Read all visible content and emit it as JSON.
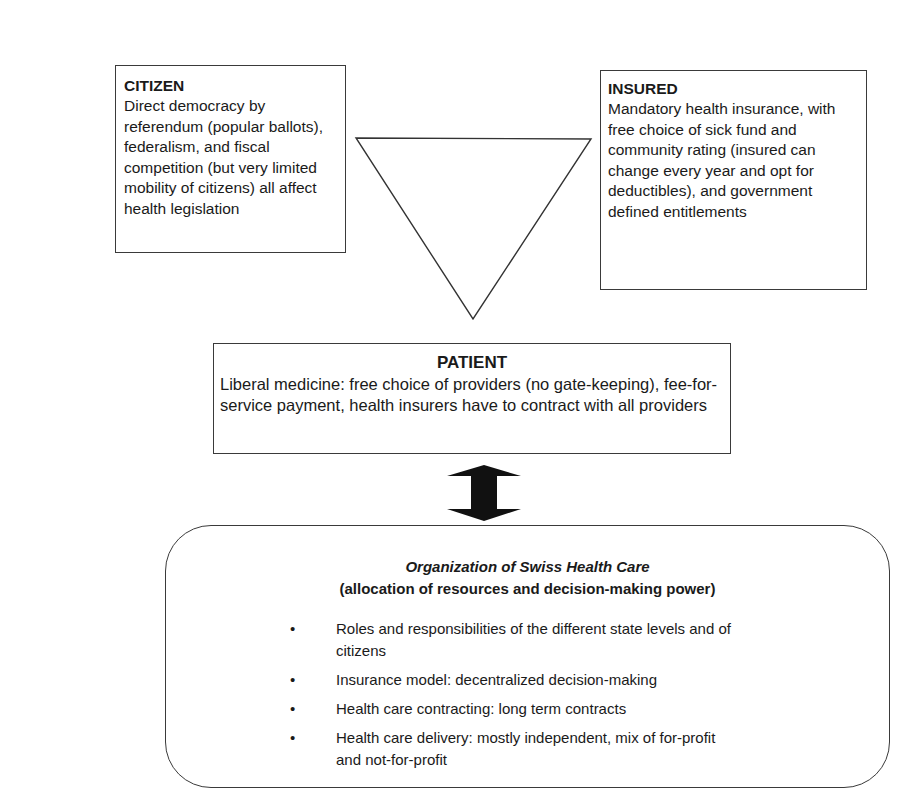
{
  "citizen": {
    "title": "CITIZEN",
    "text": "Direct democracy by referendum (popular ballots), federalism, and fiscal competition (but very limited mobility of citizens) all affect health legislation"
  },
  "insured": {
    "title": "INSURED",
    "text": "Mandatory health insurance, with free choice of sick fund and community rating (insured can change every year and opt for deductibles), and government defined entitlements"
  },
  "triangle": {
    "shape": "inverted-triangle",
    "color": "#333333"
  },
  "patient": {
    "title": "PATIENT",
    "text": "Liberal medicine: free choice of providers (no gate-keeping), fee-for-service payment, health insurers have to contract with all providers"
  },
  "arrow": {
    "shape": "double-headed-vertical-arrow",
    "color": "#111111"
  },
  "organization": {
    "title": "Organization of Swiss Health Care",
    "subtitle": "(allocation of resources and decision-making power)",
    "bullets": [
      "Roles and responsibilities of the different state levels and of citizens",
      "Insurance model: decentralized decision-making",
      "Health care contracting: long term contracts",
      "Health care delivery: mostly independent, mix of for-profit and not-for-profit"
    ],
    "bullet_glyph": "•"
  }
}
